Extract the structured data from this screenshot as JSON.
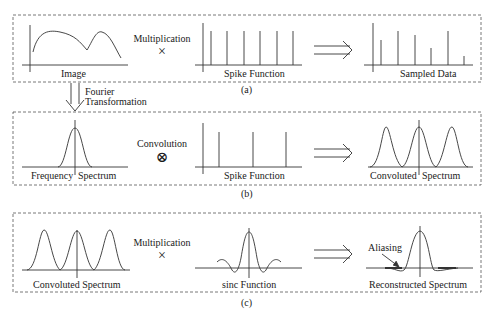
{
  "panels": {
    "a": {
      "caption": "(a)",
      "left_label": "Image",
      "operator_label": "Multiplication",
      "operator_symbol": "×",
      "middle_label": "Spike Function",
      "result_label": "Sampled Data"
    },
    "transition": {
      "label_line1": "Fourier",
      "label_line2": "Transformation"
    },
    "b": {
      "caption": "(b)",
      "left_label_part1": "Frequency",
      "left_label_part2": "Spectrum",
      "operator_label": "Convolution",
      "operator_symbol": "⊗",
      "middle_label": "Spike Function",
      "result_label_part1": "Convoluted",
      "result_label_part2": "Spectrum"
    },
    "c": {
      "caption": "(c)",
      "left_label": "Convoluted Spectrum",
      "operator_label": "Multiplication",
      "operator_symbol": "×",
      "middle_label": "sinc Function",
      "result_label": "Reconstructed Spectrum",
      "annotation": "Aliasing"
    }
  },
  "colors": {
    "line": "#333333",
    "dash": "#555555",
    "background": "#ffffff"
  }
}
